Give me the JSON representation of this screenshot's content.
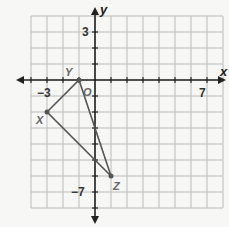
{
  "graph": {
    "x_axis_label": "x",
    "y_axis_label": "y",
    "origin_label": "O",
    "tick_labels": {
      "x_neg": "−3",
      "x_pos": "7",
      "y_pos": "3",
      "y_neg": "−7"
    },
    "x_range": [
      -4,
      8
    ],
    "y_range": [
      -8,
      4
    ],
    "grid_color": "#b8b8b8",
    "line_color": "#555555"
  },
  "triangle": {
    "vertices": [
      {
        "name": "X",
        "x": -3,
        "y": -2
      },
      {
        "name": "Y",
        "x": -1,
        "y": 0
      },
      {
        "name": "Z",
        "x": 1,
        "y": -6
      }
    ]
  }
}
